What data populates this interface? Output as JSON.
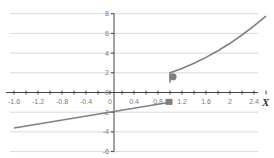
{
  "chart_data": {
    "type": "line",
    "title": "",
    "xlabel": "X",
    "ylabel": "",
    "xlim": [
      -1.7,
      2.6
    ],
    "ylim": [
      -6,
      8
    ],
    "x_ticks": [
      -1.6,
      -1.2,
      -0.8,
      -0.4,
      0,
      0.4,
      0.8,
      1.2,
      1.6,
      2,
      2.4
    ],
    "x_tick_labels": [
      "-1.6",
      "-1.2",
      "-0.8",
      "-0.4",
      "0",
      "0.4",
      "0.8",
      "1.2",
      "1.6",
      "2",
      "2.4"
    ],
    "y_ticks": [
      -6,
      -4,
      -2,
      0,
      2,
      4,
      6,
      8
    ],
    "y_tick_labels": [
      "-6",
      "-4",
      "-2",
      "0",
      "2",
      "4",
      "6",
      "8"
    ],
    "grid": true,
    "line_color": "#7f7f7f",
    "series": [
      {
        "name": "left-piece",
        "x": [
          -1.6,
          1.0
        ],
        "y": [
          -3.6,
          -1.0
        ],
        "end_marker": "open-square"
      },
      {
        "name": "right-piece",
        "x": [
          1.0,
          1.0,
          1.2,
          1.4,
          1.6,
          1.8,
          2.0,
          2.2,
          2.4,
          2.6
        ],
        "y": [
          1.0,
          2.0,
          2.44,
          2.96,
          3.56,
          4.24,
          5.0,
          5.84,
          6.76,
          7.76
        ],
        "start_marker": "filled-circle"
      }
    ],
    "markers": [
      {
        "name": "open-endpoint",
        "x": 1.0,
        "y": -1.0,
        "shape": "square"
      },
      {
        "name": "closed-endpoint",
        "x": 1.0,
        "y": 1.6,
        "shape": "circle"
      }
    ]
  }
}
